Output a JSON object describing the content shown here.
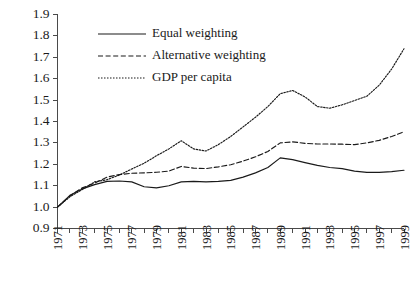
{
  "chart_data": {
    "type": "line",
    "title": "",
    "subtitle": "",
    "xlabel": "",
    "ylabel": "",
    "xlim": [
      1971,
      1999
    ],
    "ylim": [
      0.9,
      1.9
    ],
    "grid": false,
    "legend_position": "top-left-inside",
    "x": [
      1971,
      1972,
      1973,
      1974,
      1975,
      1976,
      1977,
      1978,
      1979,
      1980,
      1981,
      1982,
      1983,
      1984,
      1985,
      1986,
      1987,
      1988,
      1989,
      1990,
      1991,
      1992,
      1993,
      1994,
      1995,
      1996,
      1997,
      1998,
      1999
    ],
    "xticks": [
      1971,
      1972,
      1973,
      1974,
      1975,
      1976,
      1977,
      1978,
      1979,
      1980,
      1981,
      1982,
      1983,
      1984,
      1985,
      1986,
      1987,
      1988,
      1989,
      1990,
      1991,
      1992,
      1993,
      1994,
      1995,
      1996,
      1997,
      1998,
      1999
    ],
    "xticklabels": [
      "1971",
      "",
      "1973",
      "",
      "1975",
      "",
      "1977",
      "",
      "1979",
      "",
      "1981",
      "",
      "1983",
      "",
      "1985",
      "",
      "1987",
      "",
      "1989",
      "",
      "1991",
      "",
      "1993",
      "",
      "1995",
      "",
      "1997",
      "",
      "1999"
    ],
    "yticks": [
      0.9,
      1.0,
      1.1,
      1.2,
      1.3,
      1.4,
      1.5,
      1.6,
      1.7,
      1.8,
      1.9
    ],
    "yticklabels": [
      "0.9",
      "1.0",
      "1.1",
      "1.2",
      "1.3",
      "1.4",
      "1.5",
      "1.6",
      "1.7",
      "1.8",
      "1.9"
    ],
    "series": [
      {
        "name": "Equal weighting",
        "style": "solid",
        "color": "#1a1a1a",
        "values": [
          1.0,
          1.055,
          1.085,
          1.105,
          1.12,
          1.122,
          1.118,
          1.095,
          1.09,
          1.1,
          1.118,
          1.12,
          1.118,
          1.12,
          1.125,
          1.14,
          1.16,
          1.185,
          1.23,
          1.222,
          1.208,
          1.195,
          1.185,
          1.18,
          1.168,
          1.162,
          1.162,
          1.166,
          1.172
        ]
      },
      {
        "name": "Alternative weighting",
        "style": "dashed",
        "color": "#1a1a1a",
        "values": [
          1.0,
          1.052,
          1.09,
          1.112,
          1.14,
          1.152,
          1.158,
          1.16,
          1.163,
          1.168,
          1.19,
          1.182,
          1.18,
          1.188,
          1.198,
          1.215,
          1.235,
          1.26,
          1.3,
          1.305,
          1.298,
          1.295,
          1.295,
          1.294,
          1.292,
          1.3,
          1.312,
          1.33,
          1.352
        ]
      },
      {
        "name": "GDP per capita",
        "style": "dotted",
        "color": "#1a1a1a",
        "values": [
          1.0,
          1.048,
          1.082,
          1.118,
          1.128,
          1.15,
          1.178,
          1.205,
          1.24,
          1.272,
          1.31,
          1.272,
          1.262,
          1.292,
          1.33,
          1.375,
          1.42,
          1.47,
          1.53,
          1.545,
          1.515,
          1.47,
          1.462,
          1.478,
          1.498,
          1.518,
          1.57,
          1.645,
          1.74
        ]
      }
    ]
  },
  "legend": {
    "items": [
      {
        "label": "Equal weighting",
        "style": "solid"
      },
      {
        "label": "Alternative weighting",
        "style": "dashed"
      },
      {
        "label": "GDP per capita",
        "style": "dotted"
      }
    ]
  }
}
